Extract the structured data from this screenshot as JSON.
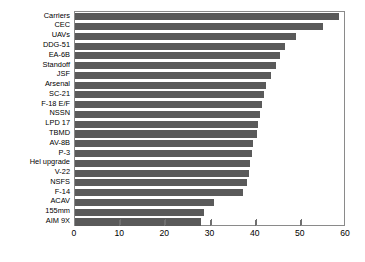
{
  "chart_data": {
    "type": "bar",
    "orientation": "horizontal",
    "title": "",
    "xlabel": "",
    "ylabel": "",
    "xlim": [
      0,
      60
    ],
    "ylim": null,
    "xticks": [
      0,
      10,
      20,
      30,
      40,
      50,
      60
    ],
    "xtick_labels": [
      "0",
      "10",
      "20",
      "30",
      "40",
      "50",
      "60"
    ],
    "grid": false,
    "legend": null,
    "bar_color": "#5a5a5a",
    "frame_color": "#8a8a8a",
    "background": "#ffffff",
    "categories": [
      "Carriers",
      "CEC",
      "UAVs",
      "DDG-51",
      "EA-6B",
      "Standoff",
      "JSF",
      "Arsenal",
      "SC-21",
      "F-18 E/F",
      "NSSN",
      "LPD 17",
      "TBMD",
      "AV-8B",
      "P-3",
      "Hel upgrade",
      "V-22",
      "NSFS",
      "F-14",
      "ACAV",
      "155mm",
      "AIM 9X"
    ],
    "values": [
      58.4,
      55.0,
      49.0,
      46.5,
      45.3,
      44.6,
      43.4,
      42.3,
      41.9,
      41.4,
      41.0,
      40.6,
      40.3,
      39.5,
      39.2,
      38.8,
      38.5,
      38.0,
      37.3,
      30.8,
      28.6,
      28.0
    ]
  }
}
